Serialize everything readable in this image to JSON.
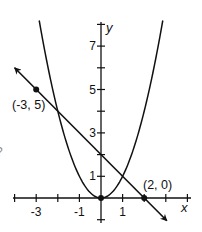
{
  "figure": {
    "axes": {
      "x_label": "x",
      "y_label": "y",
      "x_tick_labels": [
        {
          "value": -3,
          "text": "-3"
        },
        {
          "value": -1,
          "text": "-1"
        },
        {
          "value": 1,
          "text": "1"
        }
      ],
      "y_tick_labels": [
        {
          "value": 1,
          "text": "1"
        },
        {
          "value": 3,
          "text": "3"
        },
        {
          "value": 5,
          "text": "5"
        },
        {
          "value": 7,
          "text": "7"
        }
      ],
      "x_ticks": [
        -4,
        -3,
        -2,
        -1,
        1,
        2,
        3,
        4
      ],
      "y_ticks": [
        -1,
        1,
        2,
        3,
        4,
        5,
        6,
        7,
        8
      ],
      "xlim": [
        -4.1,
        4.1
      ],
      "ylim": [
        -1.1,
        8.2
      ]
    },
    "curves": [
      {
        "name": "parabola",
        "equation": "y = x^2"
      },
      {
        "name": "line",
        "equation": "y = -x + 2",
        "arrows": "both"
      }
    ],
    "points": [
      {
        "x": -3,
        "y": 5,
        "label": "(-3, 5)"
      },
      {
        "x": 2,
        "y": 0,
        "label": "(2, 0)"
      },
      {
        "x": 0,
        "y": 0,
        "label": ""
      }
    ],
    "edge_fragment": "?",
    "colors": {
      "ink": "#111111",
      "background": "#ffffff"
    }
  }
}
